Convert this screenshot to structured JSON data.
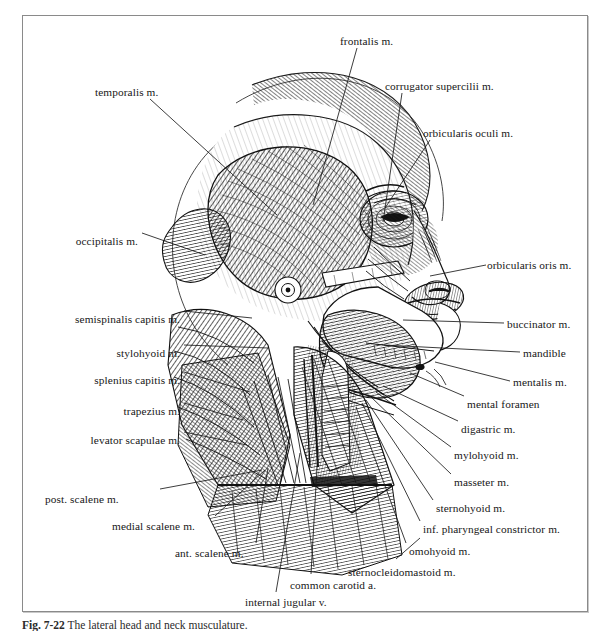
{
  "figure": {
    "caption_number": "Fig. 7-22",
    "caption_text": "The lateral head and neck musculature.",
    "frame_color": "#8a8a8a",
    "ink_color": "#171717",
    "background_color": "#ffffff",
    "illustration_style": "engraving line-hatching"
  },
  "labels": [
    {
      "id": "frontalis",
      "text": "frontalis m.",
      "align": "left",
      "x": 340,
      "y": 36,
      "lx": 357,
      "ly": 48,
      "tx": 313,
      "ty": 205
    },
    {
      "id": "corrugator-supercilii",
      "text": "corrugator supercilii m.",
      "align": "left",
      "x": 385,
      "y": 81,
      "lx": 402,
      "ly": 93,
      "tx": 383,
      "ty": 222
    },
    {
      "id": "orbicularis-oculi",
      "text": "orbicularis oculi m.",
      "align": "left",
      "x": 423,
      "y": 128,
      "lx": 430,
      "ly": 140,
      "tx": 385,
      "ty": 208
    },
    {
      "id": "orbicularis-oris",
      "text": "orbicularis oris m.",
      "align": "left",
      "x": 487,
      "y": 260,
      "lx": 486,
      "ly": 265,
      "tx": 430,
      "ty": 276
    },
    {
      "id": "buccinator",
      "text": "buccinator m.",
      "align": "left",
      "x": 507,
      "y": 319,
      "lx": 504,
      "ly": 323,
      "tx": 403,
      "ty": 320
    },
    {
      "id": "mandible",
      "text": "mandible",
      "align": "left",
      "x": 523,
      "y": 348,
      "lx": 520,
      "ly": 352,
      "tx": 384,
      "ty": 345
    },
    {
      "id": "mentalis",
      "text": "mentalis m.",
      "align": "left",
      "x": 513,
      "y": 377,
      "lx": 510,
      "ly": 381,
      "tx": 435,
      "ty": 362
    },
    {
      "id": "mental-foramen",
      "text": "mental foramen",
      "align": "left",
      "x": 467,
      "y": 399,
      "lx": 464,
      "ly": 396,
      "tx": 410,
      "ty": 373
    },
    {
      "id": "digastric",
      "text": "digastric m.",
      "align": "left",
      "x": 461,
      "y": 424,
      "lx": 458,
      "ly": 421,
      "tx": 383,
      "ty": 386
    },
    {
      "id": "mylohyoid",
      "text": "mylohyoid m.",
      "align": "left",
      "x": 454,
      "y": 450,
      "lx": 451,
      "ly": 447,
      "tx": 376,
      "ty": 392
    },
    {
      "id": "masseter",
      "text": "masseter m.",
      "align": "left",
      "x": 454,
      "y": 477,
      "lx": 451,
      "ly": 474,
      "tx": 370,
      "ty": 396
    },
    {
      "id": "sternohyoid",
      "text": "sternohyoid m.",
      "align": "left",
      "x": 436,
      "y": 503,
      "lx": 433,
      "ly": 500,
      "tx": 366,
      "ty": 400
    },
    {
      "id": "inf-pharyngeal-constrictor",
      "text": "inf. pharyngeal constrictor m.",
      "align": "left",
      "x": 423,
      "y": 524,
      "lx": 420,
      "ly": 521,
      "tx": 362,
      "ty": 403
    },
    {
      "id": "omohyoid",
      "text": "omohyoid m.",
      "align": "left",
      "x": 409,
      "y": 546,
      "lx": 406,
      "ly": 543,
      "tx": 356,
      "ty": 407
    },
    {
      "id": "sternocleidomastoid",
      "text": "sternocleidomastoid m.",
      "align": "left",
      "x": 348,
      "y": 567,
      "lx": 396,
      "ly": 559,
      "tx": 420,
      "ty": 538
    },
    {
      "id": "internal-jugular",
      "text": "internal jugular v.",
      "align": "left",
      "x": 245,
      "y": 597,
      "lx": 276,
      "ly": 592,
      "tx": 300,
      "ty": 453
    },
    {
      "id": "common-carotid",
      "text": "common carotid a.",
      "align": "left",
      "x": 290,
      "y": 580,
      "lx": 311,
      "ly": 574,
      "tx": 318,
      "ty": 450
    },
    {
      "id": "ant-scalene",
      "text": "ant. scalene m.",
      "align": "left",
      "x": 175,
      "y": 548,
      "lx": 256,
      "ly": 543,
      "tx": 268,
      "ty": 468
    },
    {
      "id": "medial-scalene",
      "text": "medial scalene m.",
      "align": "left",
      "x": 112,
      "y": 521,
      "lx": 215,
      "ly": 516,
      "tx": 265,
      "ty": 470
    },
    {
      "id": "post-scalene",
      "text": "post. scalene m.",
      "align": "left",
      "x": 45,
      "y": 494,
      "lx": 160,
      "ly": 489,
      "tx": 262,
      "ty": 470
    },
    {
      "id": "levator-scapulae",
      "text": "levator scapulae m.",
      "align": "right",
      "x": 180,
      "y": 435,
      "lx": 184,
      "ly": 432,
      "tx": 247,
      "ty": 445
    },
    {
      "id": "trapezius",
      "text": "trapezius m.",
      "align": "right",
      "x": 180,
      "y": 406,
      "lx": 184,
      "ly": 403,
      "tx": 243,
      "ty": 420
    },
    {
      "id": "splenius-capitis",
      "text": "splenius capitis m.",
      "align": "right",
      "x": 180,
      "y": 375,
      "lx": 184,
      "ly": 372,
      "tx": 250,
      "ty": 392
    },
    {
      "id": "stylohyoid",
      "text": "stylohyoid m.",
      "align": "right",
      "x": 180,
      "y": 348,
      "lx": 184,
      "ly": 345,
      "tx": 268,
      "ty": 348
    },
    {
      "id": "semispinalis-capitis",
      "text": "semispinalis capitis m.",
      "align": "right",
      "x": 180,
      "y": 314,
      "lx": 184,
      "ly": 311,
      "tx": 252,
      "ty": 318
    },
    {
      "id": "occipitalis",
      "text": "occipitalis m.",
      "align": "right",
      "x": 138,
      "y": 236,
      "lx": 142,
      "ly": 233,
      "tx": 205,
      "ty": 255
    },
    {
      "id": "temporalis",
      "text": "temporalis m.",
      "align": "left",
      "x": 95,
      "y": 87,
      "lx": 150,
      "ly": 99,
      "tx": 277,
      "ty": 215
    }
  ]
}
